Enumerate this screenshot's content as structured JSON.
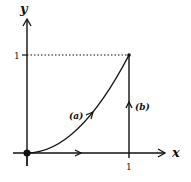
{
  "diagram": {
    "axes": {
      "x_label": "x",
      "y_label": "y",
      "x_tick": "1",
      "y_tick": "1",
      "x_tick_label_at_origin": "",
      "origin_tick": ""
    },
    "paths": [
      {
        "id": "a",
        "label": "(a)",
        "description": "curve y = x^2 from (0,0) to (1,1)"
      },
      {
        "id": "b",
        "label": "(b)",
        "description": "path along x-axis from (0,0) to (1,0) then up to (1,1)"
      }
    ],
    "points": [
      {
        "name": "origin",
        "x": 0,
        "y": 0
      },
      {
        "name": "end",
        "x": 1,
        "y": 1
      }
    ],
    "colors": {
      "ink": "#111111",
      "background": "#ffffff"
    }
  }
}
